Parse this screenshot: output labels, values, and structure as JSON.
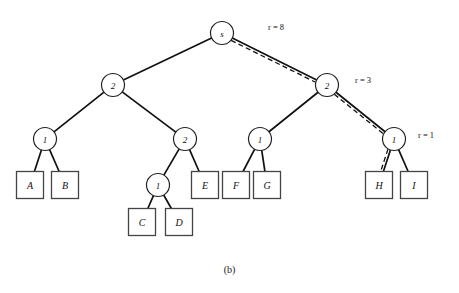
{
  "figure": {
    "caption": "(b)",
    "type": "tree-diagram"
  },
  "colors": {
    "edge": "#111111",
    "node_stroke": "#222222",
    "node_fill": "#ffffff",
    "leaf_stroke": "#444444",
    "leaf_fill": "#ffffff",
    "highlight_dash": "#111111",
    "background": "#ffffff"
  },
  "nodes": [
    {
      "id": "root",
      "label": "s",
      "cx": 222,
      "cy": 33,
      "r": 11.5
    },
    {
      "id": "n-l",
      "label": "2",
      "cx": 113,
      "cy": 85,
      "r": 11.5
    },
    {
      "id": "n-r",
      "label": "2",
      "cx": 327,
      "cy": 85,
      "r": 11.5
    },
    {
      "id": "n-ll",
      "label": "1",
      "cx": 45,
      "cy": 139,
      "r": 11.5
    },
    {
      "id": "n-lr",
      "label": "2",
      "cx": 185,
      "cy": 139,
      "r": 11.5
    },
    {
      "id": "n-rl",
      "label": "1",
      "cx": 260,
      "cy": 139,
      "r": 11.5
    },
    {
      "id": "n-rr",
      "label": "1",
      "cx": 394,
      "cy": 139,
      "r": 11.5
    },
    {
      "id": "n-lrl",
      "label": "1",
      "cx": 158,
      "cy": 185,
      "r": 11.5
    }
  ],
  "leaves": [
    {
      "id": "leaf-a",
      "label": "A",
      "cx": 30,
      "cy": 185
    },
    {
      "id": "leaf-b",
      "label": "B",
      "cx": 65,
      "cy": 185
    },
    {
      "id": "leaf-c",
      "label": "C",
      "cx": 142,
      "cy": 222
    },
    {
      "id": "leaf-d",
      "label": "D",
      "cx": 179,
      "cy": 222
    },
    {
      "id": "leaf-e",
      "label": "E",
      "cx": 205,
      "cy": 185
    },
    {
      "id": "leaf-f",
      "label": "F",
      "cx": 236,
      "cy": 185
    },
    {
      "id": "leaf-g",
      "label": "G",
      "cx": 267,
      "cy": 185
    },
    {
      "id": "leaf-h",
      "label": "H",
      "cx": 379,
      "cy": 185
    },
    {
      "id": "leaf-i",
      "label": "I",
      "cx": 414,
      "cy": 185
    }
  ],
  "leaf_box": {
    "width": 27,
    "height": 27
  },
  "edges": [
    {
      "id": "edge-root-left",
      "from": "root",
      "to": "n-l",
      "highlighted": false
    },
    {
      "id": "edge-root-right",
      "from": "root",
      "to": "n-r",
      "highlighted": true
    },
    {
      "id": "edge-l-ll",
      "from": "n-l",
      "to": "n-ll",
      "highlighted": false
    },
    {
      "id": "edge-l-lr",
      "from": "n-l",
      "to": "n-lr",
      "highlighted": false
    },
    {
      "id": "edge-r-rl",
      "from": "n-r",
      "to": "n-rl",
      "highlighted": false
    },
    {
      "id": "edge-r-rr",
      "from": "n-r",
      "to": "n-rr",
      "highlighted": true
    },
    {
      "id": "edge-ll-a",
      "from": "n-ll",
      "to": "leaf-a",
      "highlighted": false
    },
    {
      "id": "edge-ll-b",
      "from": "n-ll",
      "to": "leaf-b",
      "highlighted": false
    },
    {
      "id": "edge-lr-lrl",
      "from": "n-lr",
      "to": "n-lrl",
      "highlighted": false
    },
    {
      "id": "edge-lr-e",
      "from": "n-lr",
      "to": "leaf-e",
      "highlighted": false
    },
    {
      "id": "edge-lrl-c",
      "from": "n-lrl",
      "to": "leaf-c",
      "highlighted": false
    },
    {
      "id": "edge-lrl-d",
      "from": "n-lrl",
      "to": "leaf-d",
      "highlighted": false
    },
    {
      "id": "edge-rl-f",
      "from": "n-rl",
      "to": "leaf-f",
      "highlighted": false
    },
    {
      "id": "edge-rl-g",
      "from": "n-rl",
      "to": "leaf-g",
      "highlighted": false
    },
    {
      "id": "edge-rr-h",
      "from": "n-rr",
      "to": "leaf-h",
      "highlighted": true
    },
    {
      "id": "edge-rr-i",
      "from": "n-rr",
      "to": "leaf-i",
      "highlighted": false
    }
  ],
  "edge_weights": [
    {
      "id": "weight-r8",
      "text": "r = 8",
      "x": 268,
      "y": 27
    },
    {
      "id": "weight-r3",
      "text": "r = 3",
      "x": 355,
      "y": 80
    },
    {
      "id": "weight-r1",
      "text": "r = 1",
      "x": 418,
      "y": 135
    }
  ]
}
